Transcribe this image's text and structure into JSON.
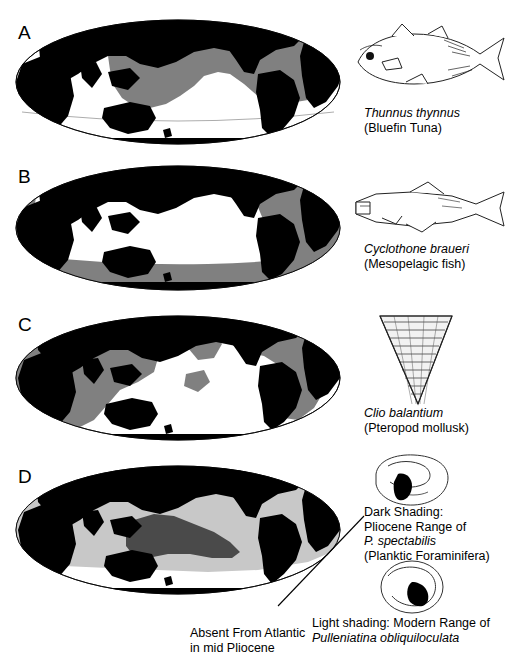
{
  "figure": {
    "width": 512,
    "height": 660,
    "background": "#ffffff",
    "colors": {
      "land": "#000000",
      "ocean": "#ffffff",
      "range_shading_mid": "#808080",
      "range_shading_light": "#c8c8c8",
      "range_shading_dark": "#4a4a4a",
      "outline": "#000000"
    }
  },
  "panels": [
    {
      "letter": "A",
      "species_scientific": "Thunnus thynnus",
      "species_common": "(Bluefin Tuna)",
      "illustration": "tuna-illustration",
      "shading": "mid-gray",
      "range_description": "Atlantic and Pacific temperate to tropical surface waters"
    },
    {
      "letter": "B",
      "species_scientific": "Cyclothone braueri",
      "species_common": "(Mesopelagic fish)",
      "illustration": "mesopelagic-fish-illustration",
      "shading": "mid-gray",
      "range_description": "Atlantic basin and circum-Antarctic Southern Ocean"
    },
    {
      "letter": "C",
      "species_scientific": "Clio balantium",
      "species_common": "(Pteropod mollusk)",
      "illustration": "pteropod-shell-illustration",
      "shading": "mid-gray",
      "range_description": "Indian Ocean, eastern Pacific and Atlantic"
    },
    {
      "letter": "D",
      "species_scientific": "P. spectabilis",
      "species_common": "(Planktic Foraminifera)",
      "illustration": "foraminifera-illustration",
      "shading": "light-gray with dark-gray core",
      "range_description": "Equatorial Indo-Pacific belt; dark core in western Pacific"
    }
  ],
  "legend": {
    "dark_shading": {
      "line1": "Dark Shading:",
      "line2": "Pliocene Range of",
      "line3_sci": "P. spectabilis",
      "line4": "(Planktic Foraminifera)",
      "illustration": "foram-dark-illustration"
    },
    "light_shading": {
      "line1": "Light shading: Modern Range of",
      "line2_sci": "Pulleniatina obliquiloculata",
      "illustration": "foram-light-illustration"
    }
  },
  "annotation": {
    "line1": "Absent From Atlantic",
    "line2": "in mid Pliocene",
    "leader": "leader-line pointing to Atlantic sector of panel D"
  }
}
